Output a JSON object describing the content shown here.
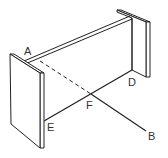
{
  "diagram": {
    "type": "geometric-frame",
    "labels": {
      "A": "A",
      "B": "B",
      "D": "D",
      "E": "E",
      "F": "F"
    },
    "colors": {
      "stroke": "#222222",
      "label": "#333333",
      "background": "#ffffff"
    }
  }
}
